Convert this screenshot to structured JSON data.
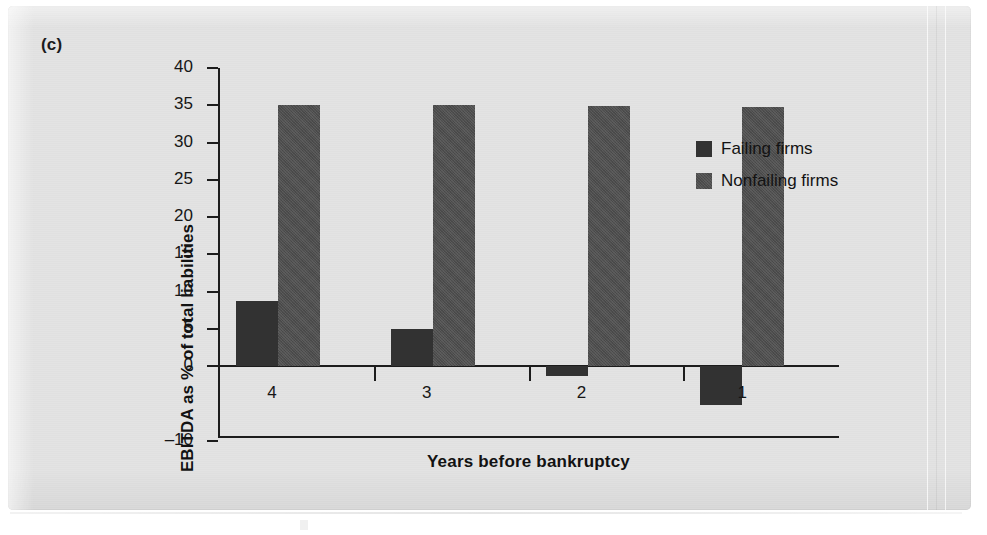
{
  "panel": {
    "label": "(c)"
  },
  "legend": {
    "position": "right",
    "items": [
      {
        "name": "Failing firms",
        "color": "#323232"
      },
      {
        "name": "Nonfailing firms",
        "color": "#4e4e4e"
      }
    ]
  },
  "chart_data": {
    "type": "bar",
    "title": "(c)",
    "xlabel": "Years before bankruptcy",
    "ylabel": "EBITDA as % of total liabilities",
    "categories": [
      "4",
      "3",
      "2",
      "1"
    ],
    "series": [
      {
        "name": "Failing firms",
        "color": "#323232",
        "values": [
          8.7,
          5.0,
          -1.3,
          -5.3
        ]
      },
      {
        "name": "Nonfailing firms",
        "color": "#4e4e4e",
        "values": [
          35.0,
          35.0,
          34.9,
          34.8
        ]
      }
    ],
    "ylim": [
      -10,
      40
    ],
    "ytick_labels": [
      "40",
      "35",
      "30",
      "25",
      "20",
      "15",
      "10",
      "5",
      "0",
      "–10"
    ],
    "ytick_values": [
      40,
      35,
      30,
      25,
      20,
      15,
      10,
      5,
      0,
      -10
    ],
    "ytick_step": 5,
    "grid": false,
    "legend_position": "right"
  }
}
